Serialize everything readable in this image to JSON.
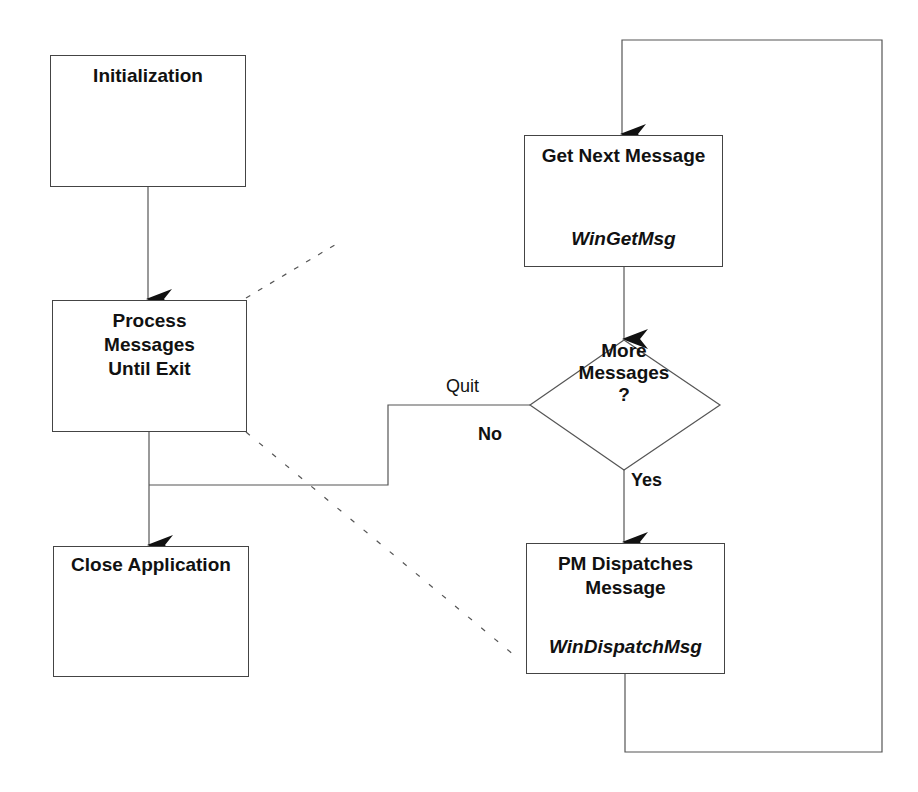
{
  "nodes": {
    "init": {
      "label": "Initialization"
    },
    "process": {
      "label": "Process\nMessages\nUntil Exit"
    },
    "close": {
      "label": "Close Application"
    },
    "get_next": {
      "label": "Get Next Message",
      "function": "WinGetMsg"
    },
    "decision": {
      "label": "More\nMessages\n?"
    },
    "dispatch": {
      "label": "PM Dispatches\nMessage",
      "function": "WinDispatchMsg"
    }
  },
  "edges": {
    "quit_label": "Quit",
    "no_label": "No",
    "yes_label": "Yes"
  }
}
